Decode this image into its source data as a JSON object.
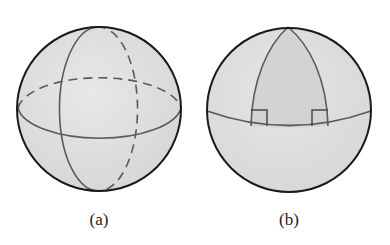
{
  "figure": {
    "panels": [
      {
        "id": "a",
        "caption": "(a)",
        "description": "Sphere with a great circle equator and a great circle meridian; hidden halves drawn dashed",
        "sphere": {
          "cx": 99,
          "cy": 109,
          "r": 82
        },
        "equator": {
          "cx": 99,
          "cy": 108,
          "rx": 82,
          "ry": 34
        },
        "meridian": {
          "cx": 98,
          "cy": 109,
          "rx": 39,
          "ry": 82
        }
      },
      {
        "id": "b",
        "caption": "(b)",
        "description": "Sphere with equator and two meridians forming a spherical triangle with two right angles at the equator",
        "sphere": {
          "cx": 289,
          "cy": 110,
          "r": 82
        },
        "apex": {
          "x": 288,
          "y": 27
        },
        "leg_feet": [
          {
            "x": 251,
            "y": 126
          },
          {
            "x": 328,
            "y": 126
          }
        ],
        "right_angle_marks": 2
      }
    ],
    "colors": {
      "sphere_fill": "#e2e2e2",
      "triangle_fill": "#d3d3d3",
      "lower_fill": "#d9d9d9",
      "outline": "#1a1a1a",
      "great_circle": "#5a5a5a",
      "caption": "#222222"
    }
  }
}
